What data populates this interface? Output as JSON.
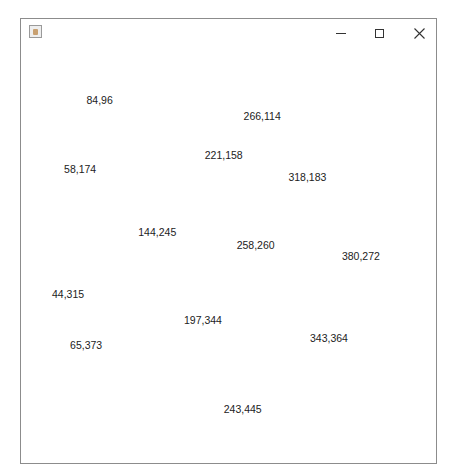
{
  "window": {
    "title": "",
    "controls": {
      "minimize": "minimize",
      "maximize": "maximize",
      "close": "close"
    }
  },
  "points": [
    {
      "x": 84,
      "y": 96,
      "label": "84,96"
    },
    {
      "x": 266,
      "y": 114,
      "label": "266,114"
    },
    {
      "x": 221,
      "y": 158,
      "label": "221,158"
    },
    {
      "x": 58,
      "y": 174,
      "label": "58,174"
    },
    {
      "x": 318,
      "y": 183,
      "label": "318,183"
    },
    {
      "x": 144,
      "y": 245,
      "label": "144,245"
    },
    {
      "x": 258,
      "y": 260,
      "label": "258,260"
    },
    {
      "x": 380,
      "y": 272,
      "label": "380,272"
    },
    {
      "x": 44,
      "y": 315,
      "label": "44,315"
    },
    {
      "x": 197,
      "y": 344,
      "label": "197,344"
    },
    {
      "x": 343,
      "y": 364,
      "label": "343,364"
    },
    {
      "x": 65,
      "y": 373,
      "label": "65,373"
    },
    {
      "x": 243,
      "y": 445,
      "label": "243,445"
    }
  ]
}
